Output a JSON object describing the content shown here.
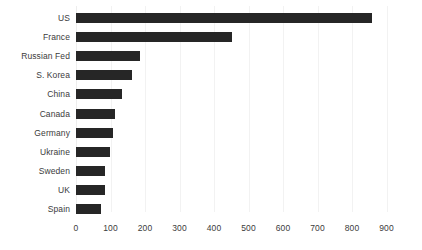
{
  "chart_data": {
    "type": "bar",
    "orientation": "horizontal",
    "title": "",
    "subtitle": "",
    "xlabel": "",
    "ylabel": "",
    "categories": [
      "US",
      "France",
      "Russian Fed",
      "S. Korea",
      "China",
      "Canada",
      "Germany",
      "Ukraine",
      "Sweden",
      "UK",
      "Spain"
    ],
    "values": [
      858,
      452,
      185,
      162,
      133,
      113,
      107,
      98,
      84,
      84,
      72
    ],
    "xlim": [
      0,
      900
    ],
    "xticks": [
      0,
      100,
      200,
      300,
      400,
      500,
      600,
      700,
      800,
      900
    ],
    "xticklabels": [
      "0",
      "100",
      "200",
      "300",
      "400",
      "500",
      "600",
      "700",
      "800",
      "900"
    ],
    "grid": "vertical",
    "legend": null,
    "bar_color": "#262626",
    "gridline_color": "#f2f2f2",
    "text_color": "#3b3b3b",
    "background": "#ffffff"
  }
}
